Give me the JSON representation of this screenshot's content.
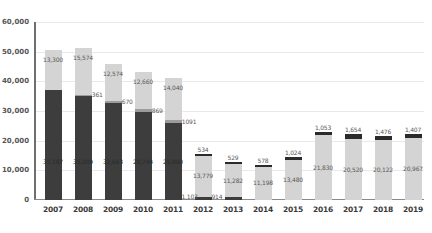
{
  "chart_data": {
    "type": "bar",
    "stacked": true,
    "title": "",
    "subtitle": "",
    "xlabel": "",
    "ylabel": "",
    "ylim": [
      0,
      60000
    ],
    "grid": true,
    "legend": "none",
    "categories": [
      "2007",
      "2008",
      "2009",
      "2010",
      "2011",
      "2012",
      "2013",
      "2014",
      "2015",
      "2016",
      "2017",
      "2018",
      "2019"
    ],
    "ytick_labels": [
      "60,000",
      "50,000",
      "40,000",
      "30,000",
      "20,000",
      "10,000",
      "0"
    ],
    "ytick_values": [
      60000,
      50000,
      40000,
      30000,
      20000,
      10000,
      0
    ],
    "series": [
      {
        "name": "bottom-segment",
        "color": "#3d3d3d",
        "values": [
          37187,
          35009,
          32663,
          29744,
          25890,
          1103,
          914,
          0,
          0,
          0,
          0,
          0,
          0
        ],
        "labels": [
          "37,187",
          "35,009",
          "32,663",
          "29,744",
          "25,890",
          "1,103",
          "914",
          "",
          "",
          "",
          "",
          "",
          ""
        ]
      },
      {
        "name": "middle-segment",
        "color": "#9c9c9c",
        "values": [
          0,
          361,
          670,
          869,
          1091,
          0,
          0,
          0,
          0,
          0,
          0,
          0,
          0
        ],
        "labels": [
          "",
          "361",
          "670",
          "869",
          "1091",
          "",
          "",
          "",
          "",
          "",
          "",
          "",
          ""
        ]
      },
      {
        "name": "body-segment",
        "color": "#d4d4d4",
        "values": [
          13300,
          15574,
          12574,
          12660,
          14040,
          13779,
          11282,
          11198,
          13480,
          21830,
          20520,
          20122,
          20967
        ],
        "labels": [
          "13,300",
          "15,574",
          "12,574",
          "12,660",
          "14,040",
          "13,779",
          "11,282",
          "11,198",
          "13,480",
          "21,830",
          "20,520",
          "20,122",
          "20,967"
        ]
      },
      {
        "name": "cap-segment",
        "color": "#2b2b2b",
        "values": [
          0,
          0,
          0,
          0,
          0,
          534,
          529,
          578,
          1024,
          1053,
          1654,
          1476,
          1407
        ],
        "labels": [
          "",
          "",
          "",
          "",
          "",
          "534",
          "529",
          "578",
          "1,024",
          "1,053",
          "1,654",
          "1,476",
          "1,407"
        ]
      }
    ]
  }
}
